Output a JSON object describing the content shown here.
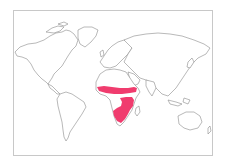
{
  "map": {
    "type": "world-distribution-map",
    "projection": "equirectangular-like",
    "background_color": "#ffffff",
    "land_fill": "#ffffff",
    "coastline_color": "#8a8a8a",
    "frame_color": "#c8c8c8",
    "range_color": "#f03c6e",
    "highlighted_regions": [
      {
        "name": "sahel-band",
        "description": "East-west band across sub-Saharan Africa"
      },
      {
        "name": "southern-central-africa",
        "description": "Southern and east-central Africa"
      }
    ]
  }
}
